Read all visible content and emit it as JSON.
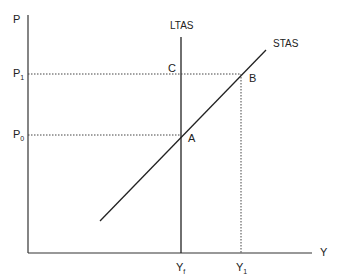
{
  "diagram": {
    "axes": {
      "y_label": "P",
      "x_label": "Y"
    },
    "price_levels": [
      {
        "id": "p1",
        "main": "P",
        "sub": "1"
      },
      {
        "id": "p0",
        "main": "P",
        "sub": "0"
      }
    ],
    "output_levels": [
      {
        "id": "yf",
        "main": "Y",
        "sub": "f"
      },
      {
        "id": "y1",
        "main": "Y",
        "sub": "1"
      }
    ],
    "curves": {
      "ltas": "LTAS",
      "stas": "STAS"
    },
    "points": {
      "a": "A",
      "b": "B",
      "c": "C"
    },
    "colors": {
      "line": "#222222",
      "background": "#ffffff"
    }
  }
}
